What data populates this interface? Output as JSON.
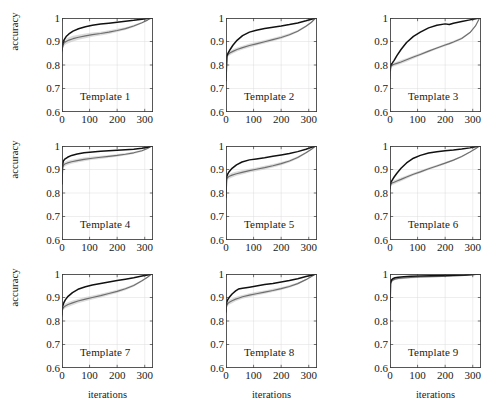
{
  "figure": {
    "type": "line-grid",
    "rows": 3,
    "cols": 3,
    "width": 493,
    "height": 400,
    "background": "#ffffff",
    "axis_color": "#3a3a3a",
    "grid_color": "#cfcfcf",
    "dark_curve_color": "#111111",
    "gray_curve_color": "#6e6e6e",
    "band_color": "#c6c6c6",
    "ylabel": "accuracy",
    "xlabel": "iterations"
  },
  "axes": {
    "xlim": [
      0,
      330
    ],
    "ylim": [
      0.6,
      1.0
    ],
    "xticks": [
      0,
      100,
      200,
      300
    ],
    "xticklabels": [
      "0",
      "100",
      "200",
      "300"
    ],
    "yticks": [
      0.6,
      0.7,
      0.8,
      0.9,
      1.0
    ],
    "yticklabels": [
      "0.6",
      "0.7",
      "0.8",
      "0.9",
      "1"
    ],
    "grid": true,
    "legend": "none"
  },
  "chart_data": [
    {
      "type": "line",
      "title": "Template 1",
      "xlabel": "iterations",
      "ylabel": "accuracy",
      "xlim": [
        0,
        330
      ],
      "ylim": [
        0.6,
        1.0
      ],
      "x": [
        0,
        3,
        8,
        15,
        25,
        40,
        60,
        85,
        110,
        140,
        170,
        200,
        230,
        260,
        290,
        310,
        325
      ],
      "series": [
        {
          "name": "dark",
          "values": [
            0.862,
            0.893,
            0.908,
            0.921,
            0.932,
            0.944,
            0.954,
            0.963,
            0.969,
            0.974,
            0.978,
            0.982,
            0.986,
            0.99,
            0.995,
            0.998,
            1.0
          ]
        },
        {
          "name": "gray",
          "values": [
            0.857,
            0.884,
            0.894,
            0.9,
            0.906,
            0.912,
            0.918,
            0.924,
            0.929,
            0.934,
            0.94,
            0.947,
            0.955,
            0.966,
            0.98,
            0.991,
            1.0
          ]
        },
        {
          "name": "gray_band_upper",
          "values": [
            0.872,
            0.896,
            0.906,
            0.912,
            0.918,
            0.924,
            0.929,
            0.934,
            0.938,
            0.942,
            0.948,
            0.954,
            0.961,
            0.971,
            0.983,
            0.993,
            1.0
          ]
        },
        {
          "name": "gray_band_lower",
          "values": [
            0.842,
            0.872,
            0.882,
            0.888,
            0.894,
            0.9,
            0.907,
            0.914,
            0.92,
            0.926,
            0.932,
            0.94,
            0.949,
            0.961,
            0.977,
            0.989,
            1.0
          ]
        }
      ]
    },
    {
      "type": "line",
      "title": "Template 2",
      "xlabel": "iterations",
      "ylabel": "accuracy",
      "xlim": [
        0,
        330
      ],
      "ylim": [
        0.6,
        1.0
      ],
      "x": [
        0,
        3,
        8,
        15,
        25,
        40,
        60,
        85,
        110,
        140,
        170,
        200,
        230,
        260,
        290,
        310,
        325
      ],
      "series": [
        {
          "name": "dark",
          "values": [
            0.733,
            0.838,
            0.852,
            0.866,
            0.884,
            0.905,
            0.925,
            0.94,
            0.948,
            0.955,
            0.961,
            0.966,
            0.972,
            0.979,
            0.988,
            0.995,
            1.0
          ]
        },
        {
          "name": "gray",
          "values": [
            0.745,
            0.835,
            0.845,
            0.852,
            0.858,
            0.866,
            0.874,
            0.883,
            0.89,
            0.899,
            0.908,
            0.917,
            0.929,
            0.944,
            0.965,
            0.982,
            1.0
          ]
        },
        {
          "name": "gray_band_upper",
          "values": [
            0.76,
            0.845,
            0.854,
            0.861,
            0.867,
            0.874,
            0.882,
            0.891,
            0.898,
            0.906,
            0.915,
            0.924,
            0.935,
            0.949,
            0.969,
            0.985,
            1.0
          ]
        },
        {
          "name": "gray_band_lower",
          "values": [
            0.73,
            0.825,
            0.836,
            0.843,
            0.849,
            0.857,
            0.866,
            0.875,
            0.883,
            0.892,
            0.901,
            0.911,
            0.923,
            0.939,
            0.961,
            0.979,
            1.0
          ]
        }
      ]
    },
    {
      "type": "line",
      "title": "Template 3",
      "xlabel": "iterations",
      "ylabel": "accuracy",
      "xlim": [
        0,
        330
      ],
      "ylim": [
        0.6,
        1.0
      ],
      "x": [
        0,
        3,
        8,
        15,
        25,
        40,
        60,
        85,
        110,
        140,
        170,
        200,
        215,
        230,
        260,
        290,
        310,
        325
      ],
      "series": [
        {
          "name": "dark",
          "values": [
            0.775,
            0.8,
            0.808,
            0.82,
            0.84,
            0.866,
            0.896,
            0.922,
            0.94,
            0.958,
            0.969,
            0.975,
            0.972,
            0.978,
            0.985,
            0.992,
            0.997,
            1.0
          ]
        },
        {
          "name": "gray",
          "values": [
            0.742,
            0.798,
            0.8,
            0.803,
            0.807,
            0.813,
            0.822,
            0.834,
            0.845,
            0.859,
            0.872,
            0.885,
            0.891,
            0.898,
            0.913,
            0.938,
            0.966,
            1.0
          ]
        },
        {
          "name": "gray_band_upper",
          "values": [
            0.758,
            0.806,
            0.808,
            0.811,
            0.815,
            0.821,
            0.829,
            0.84,
            0.851,
            0.864,
            0.877,
            0.89,
            0.896,
            0.903,
            0.918,
            0.942,
            0.969,
            1.0
          ]
        },
        {
          "name": "gray_band_lower",
          "values": [
            0.728,
            0.79,
            0.792,
            0.795,
            0.799,
            0.805,
            0.814,
            0.827,
            0.839,
            0.853,
            0.867,
            0.88,
            0.886,
            0.893,
            0.908,
            0.934,
            0.963,
            1.0
          ]
        }
      ]
    },
    {
      "type": "line",
      "title": "Template 4",
      "xlabel": "iterations",
      "ylabel": "accuracy",
      "xlim": [
        0,
        330
      ],
      "ylim": [
        0.6,
        1.0
      ],
      "x": [
        0,
        2,
        5,
        10,
        20,
        35,
        55,
        80,
        110,
        140,
        170,
        200,
        230,
        260,
        290,
        310,
        325
      ],
      "series": [
        {
          "name": "dark",
          "values": [
            0.84,
            0.92,
            0.936,
            0.944,
            0.952,
            0.96,
            0.966,
            0.971,
            0.975,
            0.978,
            0.98,
            0.982,
            0.984,
            0.986,
            0.99,
            0.995,
            1.0
          ]
        },
        {
          "name": "gray",
          "values": [
            0.836,
            0.908,
            0.918,
            0.923,
            0.928,
            0.933,
            0.938,
            0.943,
            0.948,
            0.952,
            0.956,
            0.96,
            0.965,
            0.971,
            0.98,
            0.989,
            1.0
          ]
        },
        {
          "name": "gray_band_upper",
          "values": [
            0.851,
            0.919,
            0.928,
            0.933,
            0.937,
            0.942,
            0.946,
            0.951,
            0.955,
            0.959,
            0.962,
            0.966,
            0.97,
            0.976,
            0.984,
            0.992,
            1.0
          ]
        },
        {
          "name": "gray_band_lower",
          "values": [
            0.821,
            0.897,
            0.908,
            0.913,
            0.919,
            0.924,
            0.93,
            0.935,
            0.941,
            0.945,
            0.95,
            0.954,
            0.96,
            0.966,
            0.976,
            0.986,
            1.0
          ]
        }
      ]
    },
    {
      "type": "line",
      "title": "Template 5",
      "xlabel": "iterations",
      "ylabel": "accuracy",
      "xlim": [
        0,
        330
      ],
      "ylim": [
        0.6,
        1.0
      ],
      "x": [
        0,
        2,
        6,
        12,
        22,
        38,
        58,
        85,
        110,
        140,
        170,
        200,
        230,
        260,
        290,
        310,
        325
      ],
      "series": [
        {
          "name": "dark",
          "values": [
            0.782,
            0.868,
            0.88,
            0.892,
            0.905,
            0.92,
            0.932,
            0.941,
            0.945,
            0.95,
            0.956,
            0.962,
            0.968,
            0.976,
            0.986,
            0.994,
            1.0
          ]
        },
        {
          "name": "gray",
          "values": [
            0.779,
            0.86,
            0.866,
            0.871,
            0.876,
            0.882,
            0.888,
            0.895,
            0.901,
            0.908,
            0.916,
            0.925,
            0.936,
            0.951,
            0.971,
            0.986,
            1.0
          ]
        },
        {
          "name": "gray_band_upper",
          "values": [
            0.793,
            0.87,
            0.876,
            0.881,
            0.886,
            0.891,
            0.897,
            0.903,
            0.909,
            0.916,
            0.923,
            0.932,
            0.942,
            0.956,
            0.975,
            0.989,
            1.0
          ]
        },
        {
          "name": "gray_band_lower",
          "values": [
            0.765,
            0.85,
            0.856,
            0.861,
            0.866,
            0.873,
            0.879,
            0.887,
            0.893,
            0.9,
            0.909,
            0.918,
            0.93,
            0.946,
            0.967,
            0.983,
            1.0
          ]
        }
      ]
    },
    {
      "type": "line",
      "title": "Template 6",
      "xlabel": "iterations",
      "ylabel": "accuracy",
      "xlim": [
        0,
        330
      ],
      "ylim": [
        0.6,
        1.0
      ],
      "x": [
        0,
        3,
        8,
        15,
        25,
        40,
        60,
        85,
        110,
        140,
        170,
        200,
        230,
        260,
        290,
        310,
        325
      ],
      "series": [
        {
          "name": "dark",
          "values": [
            0.818,
            0.845,
            0.855,
            0.868,
            0.884,
            0.905,
            0.928,
            0.948,
            0.96,
            0.97,
            0.976,
            0.98,
            0.983,
            0.987,
            0.992,
            0.997,
            1.0
          ]
        },
        {
          "name": "gray",
          "values": [
            0.83,
            0.84,
            0.843,
            0.846,
            0.851,
            0.858,
            0.868,
            0.88,
            0.89,
            0.903,
            0.915,
            0.927,
            0.94,
            0.955,
            0.974,
            0.988,
            1.0
          ]
        },
        {
          "name": "gray_band_upper",
          "values": [
            0.843,
            0.849,
            0.852,
            0.855,
            0.859,
            0.866,
            0.875,
            0.886,
            0.896,
            0.908,
            0.92,
            0.932,
            0.944,
            0.959,
            0.977,
            0.99,
            1.0
          ]
        },
        {
          "name": "gray_band_lower",
          "values": [
            0.817,
            0.831,
            0.834,
            0.837,
            0.843,
            0.85,
            0.861,
            0.874,
            0.884,
            0.898,
            0.91,
            0.922,
            0.936,
            0.951,
            0.971,
            0.986,
            1.0
          ]
        }
      ]
    },
    {
      "type": "line",
      "title": "Template 7",
      "xlabel": "iterations",
      "ylabel": "accuracy",
      "xlim": [
        0,
        330
      ],
      "ylim": [
        0.6,
        1.0
      ],
      "x": [
        0,
        2,
        6,
        12,
        22,
        38,
        58,
        85,
        110,
        140,
        170,
        200,
        230,
        260,
        290,
        310,
        325
      ],
      "series": [
        {
          "name": "dark",
          "values": [
            0.828,
            0.862,
            0.876,
            0.89,
            0.905,
            0.921,
            0.935,
            0.946,
            0.953,
            0.96,
            0.966,
            0.972,
            0.978,
            0.984,
            0.991,
            0.996,
            1.0
          ]
        },
        {
          "name": "gray",
          "values": [
            0.82,
            0.852,
            0.858,
            0.864,
            0.87,
            0.877,
            0.885,
            0.893,
            0.9,
            0.908,
            0.917,
            0.926,
            0.937,
            0.951,
            0.971,
            0.986,
            1.0
          ]
        },
        {
          "name": "gray_band_upper",
          "values": [
            0.835,
            0.862,
            0.868,
            0.874,
            0.88,
            0.887,
            0.894,
            0.902,
            0.908,
            0.916,
            0.924,
            0.933,
            0.943,
            0.956,
            0.975,
            0.989,
            1.0
          ]
        },
        {
          "name": "gray_band_lower",
          "values": [
            0.805,
            0.842,
            0.848,
            0.854,
            0.86,
            0.867,
            0.876,
            0.884,
            0.892,
            0.9,
            0.91,
            0.919,
            0.931,
            0.946,
            0.967,
            0.983,
            1.0
          ]
        }
      ]
    },
    {
      "type": "line",
      "title": "Template 8",
      "xlabel": "iterations",
      "ylabel": "accuracy",
      "xlim": [
        0,
        330
      ],
      "ylim": [
        0.6,
        1.0
      ],
      "x": [
        0,
        2,
        6,
        12,
        22,
        35,
        45,
        60,
        85,
        110,
        140,
        170,
        200,
        230,
        260,
        290,
        310,
        325
      ],
      "series": [
        {
          "name": "dark",
          "values": [
            0.84,
            0.878,
            0.89,
            0.901,
            0.915,
            0.928,
            0.936,
            0.939,
            0.944,
            0.949,
            0.955,
            0.96,
            0.966,
            0.972,
            0.98,
            0.989,
            0.995,
            1.0
          ]
        },
        {
          "name": "gray",
          "values": [
            0.836,
            0.866,
            0.874,
            0.88,
            0.886,
            0.893,
            0.897,
            0.903,
            0.91,
            0.916,
            0.923,
            0.93,
            0.938,
            0.947,
            0.959,
            0.976,
            0.989,
            1.0
          ]
        },
        {
          "name": "gray_band_upper",
          "values": [
            0.851,
            0.877,
            0.884,
            0.89,
            0.896,
            0.902,
            0.906,
            0.911,
            0.918,
            0.924,
            0.93,
            0.937,
            0.944,
            0.953,
            0.964,
            0.979,
            0.991,
            1.0
          ]
        },
        {
          "name": "gray_band_lower",
          "values": [
            0.821,
            0.855,
            0.864,
            0.87,
            0.876,
            0.884,
            0.888,
            0.895,
            0.902,
            0.908,
            0.916,
            0.923,
            0.932,
            0.941,
            0.954,
            0.973,
            0.987,
            1.0
          ]
        }
      ]
    },
    {
      "type": "line",
      "title": "Template 9",
      "xlabel": "iterations",
      "ylabel": "accuracy",
      "xlim": [
        0,
        330
      ],
      "ylim": [
        0.6,
        1.0
      ],
      "x": [
        0,
        2,
        5,
        10,
        18,
        30,
        50,
        75,
        110,
        150,
        190,
        230,
        270,
        300,
        325
      ],
      "series": [
        {
          "name": "dark",
          "values": [
            0.848,
            0.962,
            0.974,
            0.98,
            0.984,
            0.986,
            0.988,
            0.99,
            0.991,
            0.993,
            0.994,
            0.995,
            0.996,
            0.998,
            1.0
          ]
        },
        {
          "name": "gray",
          "values": [
            0.846,
            0.957,
            0.968,
            0.974,
            0.978,
            0.981,
            0.983,
            0.985,
            0.987,
            0.989,
            0.99,
            0.992,
            0.994,
            0.997,
            1.0
          ]
        },
        {
          "name": "gray_band_upper",
          "values": [
            0.858,
            0.963,
            0.973,
            0.979,
            0.982,
            0.985,
            0.987,
            0.989,
            0.99,
            0.992,
            0.993,
            0.994,
            0.996,
            0.998,
            1.0
          ]
        },
        {
          "name": "gray_band_lower",
          "values": [
            0.834,
            0.951,
            0.963,
            0.969,
            0.974,
            0.977,
            0.979,
            0.981,
            0.984,
            0.986,
            0.987,
            0.99,
            0.992,
            0.996,
            1.0
          ]
        }
      ]
    }
  ]
}
